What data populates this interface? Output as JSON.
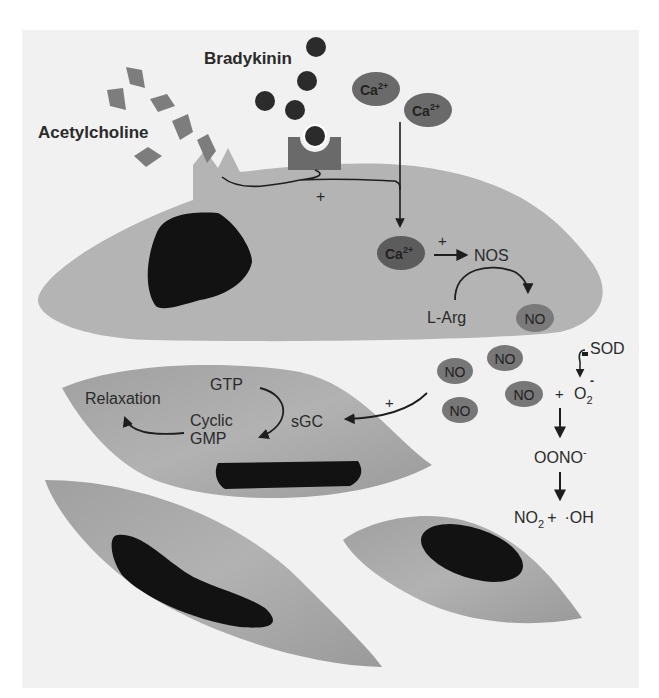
{
  "figure": {
    "colors": {
      "panel_bg": "#f1f1f1",
      "cell_fill": "#b4b4b4",
      "smooth_muscle_fill": "#a3a3a3",
      "nucleus": "#121212",
      "molecule_dark": "#2b2b2b",
      "acetylcholine": "#7d7d7d",
      "receptor": "#6a6a6a",
      "oval_fill": "#6e6e6e",
      "text": "#222222"
    }
  },
  "ligands": {
    "bradykinin": "Bradykinin",
    "acetylcholine": "Acetylcholine"
  },
  "ions": {
    "ca_outside_1": {
      "base": "Ca",
      "sup": "2+"
    },
    "ca_outside_2": {
      "base": "Ca",
      "sup": "2+"
    },
    "ca_inside": {
      "base": "Ca",
      "sup": "2+"
    }
  },
  "endothelial_cell": {
    "plus_receptor": "+",
    "plus_ca_nos": "+",
    "nos": "NOS",
    "l_arg": "L-Arg",
    "no_product": "NO"
  },
  "diffusing_no": [
    "NO",
    "NO",
    "NO",
    "NO"
  ],
  "peroxynitrite_pathway": {
    "sod": "SOD",
    "sod_sign": "−",
    "no": "NO",
    "plus": "+",
    "superoxide": {
      "base": "O",
      "sub": "2",
      "sup": "-"
    },
    "peroxynitrite": {
      "base": "OONO",
      "sup": "-"
    },
    "products": {
      "no2_base": "NO",
      "no2_sub": "2",
      "plus": "+",
      "hydroxyl": "·OH"
    }
  },
  "smooth_muscle": {
    "relaxation": "Relaxation",
    "gtp": "GTP",
    "cyclic": "Cyclic",
    "gmp": "GMP",
    "sgc": "sGC",
    "plus_no_sgc": "+"
  }
}
